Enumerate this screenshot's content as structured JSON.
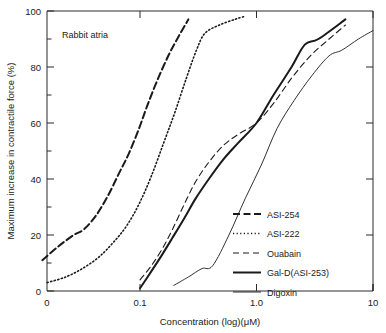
{
  "figure": {
    "annotation": "Rabbit atria",
    "background": "#ffffff",
    "ink_color": "#1a1a1a"
  },
  "chart_data": {
    "type": "line",
    "title": "",
    "annotation": "Rabbit atria",
    "xlabel": "Concentration  (log)(μM)",
    "ylabel": "Maximum increase in contractile force (%)",
    "x_scale": "log",
    "x_axis_break_label": "0",
    "xlim": [
      0.1,
      10
    ],
    "ylim": [
      0,
      100
    ],
    "grid": false,
    "legend_position": "inside-lower-right",
    "x_tick_labels": [
      "0",
      "0.1",
      "1.0",
      "10"
    ],
    "x_tick_values": [
      0,
      0.1,
      1.0,
      10
    ],
    "y_tick_labels": [
      "0",
      "20",
      "40",
      "60",
      "80",
      "100"
    ],
    "y_tick_values": [
      0,
      20,
      40,
      60,
      80,
      100
    ],
    "y_minor_tick_values": [
      10,
      30,
      50,
      70,
      90
    ],
    "series": [
      {
        "name": "ASI-254",
        "style": "dashed-thick",
        "points": [
          [
            0.0145,
            11
          ],
          [
            0.02,
            16
          ],
          [
            0.027,
            20
          ],
          [
            0.033,
            22
          ],
          [
            0.042,
            27
          ],
          [
            0.053,
            34
          ],
          [
            0.066,
            42
          ],
          [
            0.08,
            49
          ],
          [
            0.098,
            58
          ],
          [
            0.115,
            66
          ],
          [
            0.14,
            75
          ],
          [
            0.175,
            84
          ],
          [
            0.215,
            91
          ],
          [
            0.26,
            97
          ]
        ]
      },
      {
        "name": "ASI-222",
        "style": "dotted",
        "points": [
          [
            0.016,
            3
          ],
          [
            0.023,
            5
          ],
          [
            0.032,
            8
          ],
          [
            0.044,
            12
          ],
          [
            0.058,
            17
          ],
          [
            0.076,
            23
          ],
          [
            0.098,
            31
          ],
          [
            0.125,
            41
          ],
          [
            0.16,
            53
          ],
          [
            0.2,
            64
          ],
          [
            0.25,
            76
          ],
          [
            0.305,
            86
          ],
          [
            0.36,
            92
          ],
          [
            0.48,
            95
          ],
          [
            0.65,
            97
          ],
          [
            0.78,
            98
          ]
        ]
      },
      {
        "name": "Ouabain",
        "style": "dashed-thin",
        "points": [
          [
            0.1,
            4
          ],
          [
            0.125,
            9
          ],
          [
            0.155,
            15
          ],
          [
            0.19,
            22
          ],
          [
            0.24,
            31
          ],
          [
            0.3,
            39
          ],
          [
            0.39,
            46
          ],
          [
            0.52,
            52
          ],
          [
            0.7,
            56
          ],
          [
            1.0,
            60
          ],
          [
            1.4,
            67
          ],
          [
            2.0,
            76
          ],
          [
            2.9,
            84
          ],
          [
            4.2,
            90
          ],
          [
            5.8,
            95
          ]
        ]
      },
      {
        "name": "Gal-D(ASI-253)",
        "style": "solid-thick",
        "points": [
          [
            0.1,
            1
          ],
          [
            0.125,
            7
          ],
          [
            0.155,
            13
          ],
          [
            0.19,
            19
          ],
          [
            0.24,
            26
          ],
          [
            0.3,
            33
          ],
          [
            0.39,
            40
          ],
          [
            0.52,
            47
          ],
          [
            0.7,
            53
          ],
          [
            1.0,
            60
          ],
          [
            1.4,
            70
          ],
          [
            2.0,
            80
          ],
          [
            2.6,
            88
          ],
          [
            3.4,
            90
          ],
          [
            5.8,
            97
          ]
        ]
      },
      {
        "name": "Digoxin",
        "style": "solid-thin",
        "points": [
          [
            0.195,
            2
          ],
          [
            0.26,
            5
          ],
          [
            0.34,
            8
          ],
          [
            0.42,
            9
          ],
          [
            0.58,
            20
          ],
          [
            0.8,
            33
          ],
          [
            1.1,
            45
          ],
          [
            1.5,
            58
          ],
          [
            2.1,
            68
          ],
          [
            3.0,
            77
          ],
          [
            4.2,
            84
          ],
          [
            5.4,
            86
          ],
          [
            7.5,
            90
          ],
          [
            10.0,
            93
          ]
        ]
      }
    ]
  },
  "legend": {
    "items": [
      {
        "label": "ASI-254",
        "style": "dashed-thick"
      },
      {
        "label": "ASI-222",
        "style": "dotted"
      },
      {
        "label": "Ouabain",
        "style": "dashed-thin"
      },
      {
        "label": "Gal-D(ASI-253)",
        "style": "solid-thick"
      },
      {
        "label": "Digoxin",
        "style": "solid-thin"
      }
    ]
  },
  "axes": {
    "x_title": "Concentration  (log)(μM)",
    "y_title": "Maximum increase in contractile force (%)"
  }
}
